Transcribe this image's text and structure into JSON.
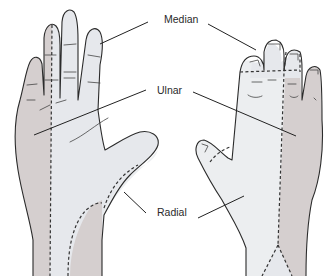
{
  "diagram": {
    "views": [
      {
        "name": "palmar",
        "position": "left"
      },
      {
        "name": "dorsal",
        "position": "right"
      }
    ],
    "labels": {
      "median": "Median",
      "ulnar": "Ulnar",
      "radial": "Radial"
    },
    "colors": {
      "median_zone": "#e6e8ec",
      "ulnar_zone": "#d5cfcf",
      "radial_zone": "#eceef0",
      "outline": "#2b2b2b",
      "background": "#ffffff"
    }
  }
}
